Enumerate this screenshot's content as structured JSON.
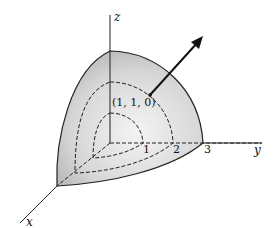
{
  "diagram": {
    "axes": {
      "x": "x",
      "y": "y",
      "z": "z"
    },
    "tick_labels": [
      "1",
      "2",
      "3"
    ],
    "point_label": "(1, 1, 0)",
    "colors": {
      "surface": "#c9c9c9",
      "surface_light": "#f2f2f2",
      "stroke": "#222222"
    }
  }
}
